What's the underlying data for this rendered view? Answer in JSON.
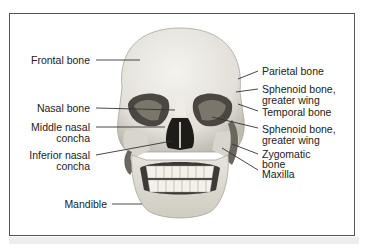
{
  "figure": {
    "labels_left": [
      {
        "id": "frontal",
        "text": "Frontal bone"
      },
      {
        "id": "nasal",
        "text": "Nasal bone"
      },
      {
        "id": "middle_concha_1",
        "text": "Middle nasal"
      },
      {
        "id": "middle_concha_2",
        "text": "concha"
      },
      {
        "id": "inferior_concha_1",
        "text": "Inferior nasal"
      },
      {
        "id": "inferior_concha_2",
        "text": "concha"
      },
      {
        "id": "mandible",
        "text": "Mandible"
      }
    ],
    "labels_right": [
      {
        "id": "parietal",
        "text": "Parietal bone"
      },
      {
        "id": "sphenoid_1a",
        "text": "Sphenoid bone,"
      },
      {
        "id": "sphenoid_1b",
        "text": "greater wing"
      },
      {
        "id": "temporal",
        "text": "Temporal bone"
      },
      {
        "id": "sphenoid_2a",
        "text": "Sphenoid bone,"
      },
      {
        "id": "sphenoid_2b",
        "text": "greater wing"
      },
      {
        "id": "zygomatic_a",
        "text": "Zygomatic"
      },
      {
        "id": "zygomatic_b",
        "text": "bone"
      },
      {
        "id": "maxilla",
        "text": "Maxilla"
      }
    ]
  }
}
